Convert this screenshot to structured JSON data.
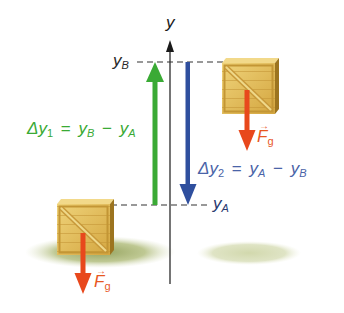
{
  "diagram": {
    "title": "",
    "axis": {
      "label": "y",
      "color": "#1a1a1a"
    },
    "levels": {
      "upper": {
        "symbol": "y",
        "subscript": "B",
        "color": "#2a2a2a"
      },
      "lower": {
        "symbol": "y",
        "subscript": "A",
        "color": "#2a3a70"
      }
    },
    "displacements": [
      {
        "id": "delta-y1",
        "lhs_symbol": "Δy",
        "lhs_subscript": "1",
        "equals": "=",
        "term1_symbol": "y",
        "term1_subscript": "B",
        "minus": "−",
        "term2_symbol": "y",
        "term2_subscript": "A",
        "direction": "up",
        "color": "#3aaa35"
      },
      {
        "id": "delta-y2",
        "lhs_symbol": "Δy",
        "lhs_subscript": "2",
        "equals": "=",
        "term1_symbol": "y",
        "term1_subscript": "A",
        "minus": "−",
        "term2_symbol": "y",
        "term2_subscript": "B",
        "direction": "down",
        "color": "#2f4f9e"
      }
    ],
    "objects": [
      {
        "id": "crate-upper",
        "kind": "wooden crate",
        "position": "y_B"
      },
      {
        "id": "crate-lower",
        "kind": "wooden crate",
        "position": "y_A"
      }
    ],
    "forces": [
      {
        "id": "gravity-upper",
        "symbol": "F",
        "subscript": "g",
        "vector": true,
        "direction": "down",
        "color": "#e8481c"
      },
      {
        "id": "gravity-lower",
        "symbol": "F",
        "subscript": "g",
        "vector": true,
        "direction": "down",
        "color": "#e8481c"
      }
    ],
    "colors": {
      "crate_light": "#e8c766",
      "crate_mid": "#d9ae45",
      "crate_dark": "#a47a22",
      "shadow": "#b9c48a",
      "dashed_line": "#333333"
    }
  }
}
